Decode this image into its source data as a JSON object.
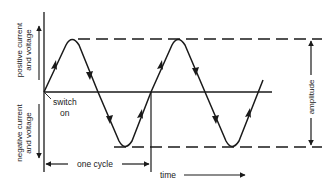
{
  "diagram": {
    "labels": {
      "positive_line1": "positive current",
      "positive_line2": "and voltage",
      "negative_line1": "negative current",
      "negative_line2": "and voltage",
      "switch_line1": "switch",
      "switch_line2": "on",
      "one_cycle": "one cycle",
      "time": "time",
      "amplitude": "amplitude"
    },
    "colors": {
      "ink": "#1a1a1a",
      "background": "#ffffff"
    }
  }
}
